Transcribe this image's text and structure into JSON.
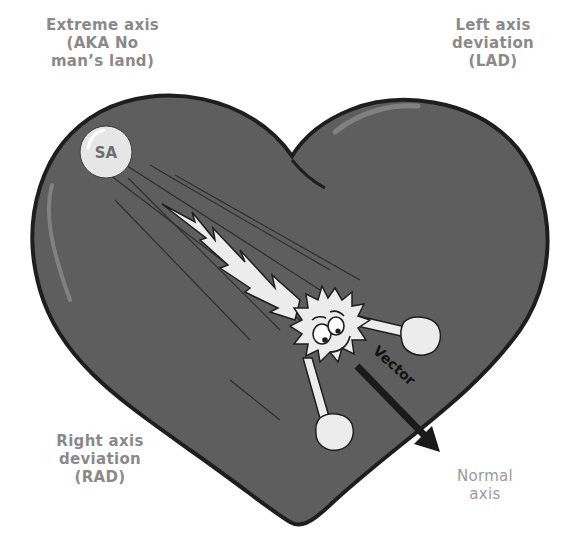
{
  "labels": {
    "extreme_axis": [
      "Extreme axis",
      "(AKA No",
      "man’s land)"
    ],
    "left_axis_deviation": [
      "Left axis",
      "deviation",
      "(LAD)"
    ],
    "right_axis_deviation": [
      "Right axis",
      "deviation",
      "(RAD)"
    ],
    "normal_axis": [
      "Normal",
      "axis"
    ]
  },
  "nodes": {
    "sa_node": "SA"
  },
  "vector": {
    "label": "Vector"
  },
  "colors": {
    "heart_fill": "#5e5e5e",
    "heart_outline": "#1e1e1e",
    "label_text": "#8a8a8a",
    "sa_fill": "#e6e6e6",
    "character_fill": "#ececec",
    "arrow": "#1a1a1a"
  }
}
